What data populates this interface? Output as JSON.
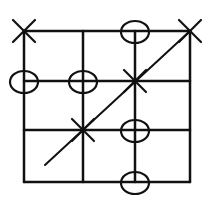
{
  "diagram": {
    "stroke_color": "#111111",
    "background": "#ffffff",
    "grid": {
      "columns": 3,
      "rows": 3,
      "x_lines": [
        24,
        83,
        135,
        190
      ],
      "y_lines": [
        31,
        81,
        130,
        182
      ]
    },
    "marks": [
      {
        "type": "X",
        "col": 0,
        "row": 0
      },
      {
        "type": "O",
        "col": 2,
        "row": 0
      },
      {
        "type": "X",
        "col": 3,
        "row": 0
      },
      {
        "type": "O",
        "col": 0,
        "row": 1
      },
      {
        "type": "O",
        "col": 1,
        "row": 1
      },
      {
        "type": "X",
        "col": 2,
        "row": 1
      },
      {
        "type": "X",
        "col": 1,
        "row": 2
      },
      {
        "type": "O",
        "col": 2,
        "row": 2
      },
      {
        "type": "O",
        "col": 2,
        "row": 3
      }
    ],
    "diagonal": {
      "from": [
        45,
        165
      ],
      "to": [
        190,
        31
      ]
    }
  }
}
